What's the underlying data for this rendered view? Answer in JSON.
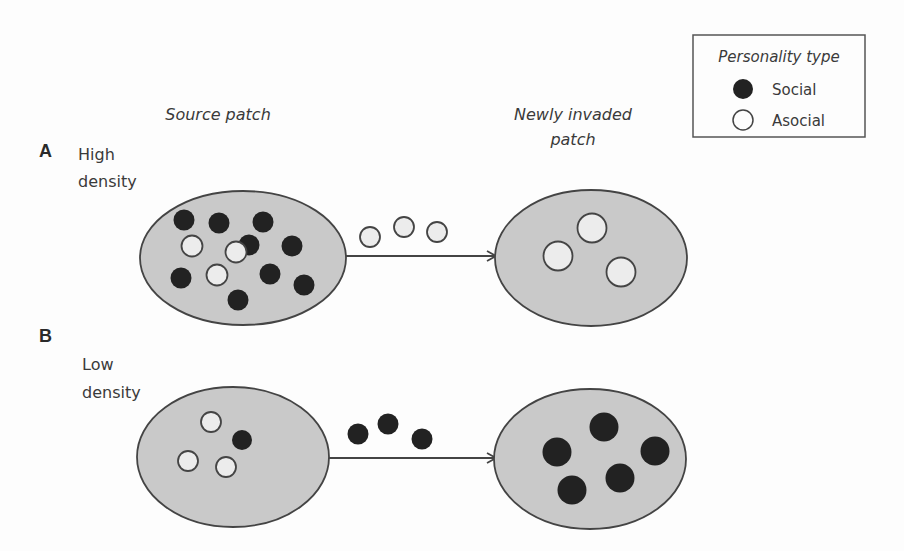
{
  "legend": {
    "title": "Personality type",
    "items": [
      {
        "label": "Social",
        "type": "social"
      },
      {
        "label": "Asocial",
        "type": "asocial"
      }
    ]
  },
  "columns": {
    "source_label": "Source patch",
    "target_label_line1": "Newly invaded",
    "target_label_line2": "patch"
  },
  "panels": [
    {
      "letter": "A",
      "density_line1": "High",
      "density_line2": "density",
      "source_counts": {
        "social": 9,
        "asocial": 3
      },
      "dispersers": {
        "social": 0,
        "asocial": 3
      },
      "target_counts": {
        "social": 0,
        "asocial": 3
      }
    },
    {
      "letter": "B",
      "density_line1": "Low",
      "density_line2": "density",
      "source_counts": {
        "social": 1,
        "asocial": 3
      },
      "dispersers": {
        "social": 3,
        "asocial": 0
      },
      "target_counts": {
        "social": 5,
        "asocial": 0
      }
    }
  ],
  "colors": {
    "social": "#222222",
    "asocial_fill": "#ececec",
    "patch_fill": "#c9c9c9",
    "stroke": "#444444"
  }
}
